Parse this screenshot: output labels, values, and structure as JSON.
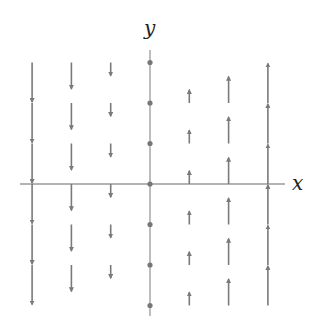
{
  "diagram": {
    "type": "vector-field",
    "x_axis_label": "x",
    "y_axis_label": "y",
    "grid": {
      "x_values": [
        -3,
        -2,
        -1,
        0,
        1,
        2,
        3
      ],
      "y_values": [
        3,
        2,
        1,
        0,
        -1,
        -2,
        -3
      ]
    },
    "colors": {
      "arrow": "#7a7a7a",
      "axis": "#9a9a9a",
      "dot": "#777777",
      "label": "#222222"
    },
    "arrows": [
      {
        "x": -3,
        "y_bases": [
          3,
          2,
          1,
          0,
          -1,
          -2
        ],
        "dx": 0,
        "dy": -3
      },
      {
        "x": -2,
        "y_bases": [
          3,
          2,
          1,
          0,
          -1,
          -2
        ],
        "dx": 0,
        "dy": -2
      },
      {
        "x": -1,
        "y_bases": [
          3,
          2,
          1,
          0,
          -1,
          -2
        ],
        "dx": 0,
        "dy": -1
      },
      {
        "x": 0,
        "y_bases": [
          3,
          2,
          1,
          0,
          -1,
          -2,
          -3
        ],
        "dx": 0,
        "dy": 0
      },
      {
        "x": 1,
        "y_bases": [
          2,
          1,
          0,
          -1,
          -2,
          -3
        ],
        "dx": 0,
        "dy": 1
      },
      {
        "x": 2,
        "y_bases": [
          2,
          1,
          0,
          -1,
          -2,
          -3
        ],
        "dx": 0,
        "dy": 2
      },
      {
        "x": 3,
        "y_bases": [
          2,
          1,
          0,
          -1,
          -2,
          -3
        ],
        "dx": 0,
        "dy": 3
      }
    ]
  }
}
